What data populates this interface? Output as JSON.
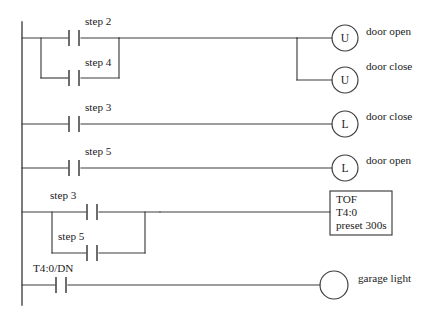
{
  "diagram": {
    "type": "ladder-logic",
    "line_color": "#3c3c3c",
    "text_color": "#1c1c1c",
    "background": "#ffffff"
  },
  "rungs": [
    {
      "id": "rung-1",
      "contacts": [
        {
          "label": "step 2",
          "type": "normally-open"
        },
        {
          "label": "step 4",
          "type": "normally-open"
        }
      ],
      "branch": "parallel",
      "outputs": [
        {
          "letter": "U",
          "label": "door open",
          "type": "unlatch-coil"
        },
        {
          "letter": "U",
          "label": "door close",
          "type": "unlatch-coil"
        }
      ]
    },
    {
      "id": "rung-2",
      "contacts": [
        {
          "label": "step 3",
          "type": "normally-open"
        }
      ],
      "branch": "series",
      "outputs": [
        {
          "letter": "L",
          "label": "door close",
          "type": "latch-coil"
        }
      ]
    },
    {
      "id": "rung-3",
      "contacts": [
        {
          "label": "step 5",
          "type": "normally-open"
        }
      ],
      "branch": "series",
      "outputs": [
        {
          "letter": "L",
          "label": "door open",
          "type": "latch-coil"
        }
      ]
    },
    {
      "id": "rung-4",
      "contacts": [
        {
          "label": "step 3",
          "type": "normally-open"
        },
        {
          "label": "step 5",
          "type": "normally-open"
        }
      ],
      "branch": "parallel",
      "outputs": [
        {
          "type": "timer-block",
          "instruction": "TOF",
          "address": "T4:0",
          "preset": "preset 300s"
        }
      ]
    },
    {
      "id": "rung-5",
      "contacts": [
        {
          "label": "T4:0/DN",
          "type": "normally-open"
        }
      ],
      "branch": "series",
      "outputs": [
        {
          "letter": "",
          "label": "garage light",
          "type": "output-coil"
        }
      ]
    }
  ]
}
